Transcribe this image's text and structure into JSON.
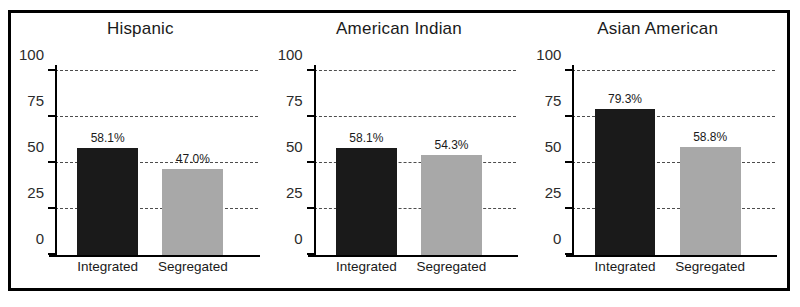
{
  "chart_data": {
    "type": "bar",
    "title": "",
    "xlabel": "",
    "ylabel": "",
    "ylim": [
      0,
      100
    ],
    "yticks": [
      0,
      25,
      50,
      75,
      100
    ],
    "ytick_labels": [
      "0",
      "25",
      "50",
      "75",
      "100"
    ],
    "grid": true,
    "legend": "none",
    "categories": [
      "Integrated",
      "Segregated"
    ],
    "panels": [
      {
        "title": "Hispanic",
        "values": [
          58.1,
          47.0
        ],
        "value_labels": [
          "58.1%",
          "47.0%"
        ],
        "colors": [
          "#1a1a1a",
          "#a8a8a8"
        ]
      },
      {
        "title": "American Indian",
        "values": [
          58.1,
          54.3
        ],
        "value_labels": [
          "58.1%",
          "54.3%"
        ],
        "colors": [
          "#1a1a1a",
          "#a8a8a8"
        ]
      },
      {
        "title": "Asian American",
        "values": [
          79.3,
          58.8
        ],
        "value_labels": [
          "79.3%",
          "58.8%"
        ],
        "colors": [
          "#1a1a1a",
          "#a8a8a8"
        ]
      }
    ]
  }
}
